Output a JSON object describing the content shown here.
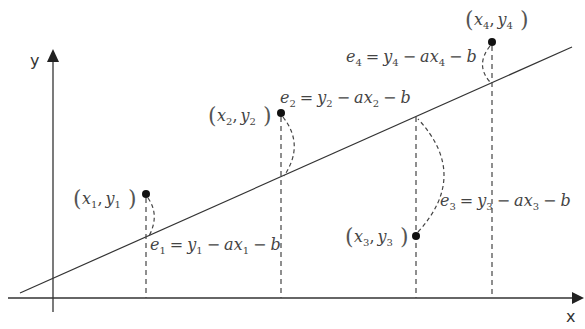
{
  "diagram": {
    "axes": {
      "x_label": "x",
      "y_label": "y"
    },
    "regression_line": {
      "equation": "y = ax + b",
      "from": [
        20,
        293
      ],
      "to": [
        572,
        47
      ]
    },
    "points": [
      {
        "id": 1,
        "label_x": "x",
        "label_y": "y",
        "sub": "1",
        "position": "above line",
        "px": [
          146,
          194
        ],
        "line_px": [
          146,
          237
        ]
      },
      {
        "id": 2,
        "label_x": "x",
        "label_y": "y",
        "sub": "2",
        "position": "above line",
        "px": [
          281,
          113
        ],
        "line_px": [
          281,
          177
        ]
      },
      {
        "id": 3,
        "label_x": "x",
        "label_y": "y",
        "sub": "3",
        "position": "below line",
        "px": [
          416,
          236
        ],
        "line_px": [
          416,
          117
        ]
      },
      {
        "id": 4,
        "label_x": "x",
        "label_y": "y",
        "sub": "4",
        "position": "above line",
        "px": [
          492,
          42
        ],
        "line_px": [
          492,
          83
        ]
      }
    ],
    "residuals": [
      {
        "id": 1,
        "e": "e",
        "sub": "1",
        "eq": "=",
        "y": "y",
        "minus1": "−",
        "a": "a",
        "x": "x",
        "minus2": "−",
        "b": "b",
        "text": "e1 = y1 − ax1 − b"
      },
      {
        "id": 2,
        "e": "e",
        "sub": "2",
        "eq": "=",
        "y": "y",
        "minus1": "−",
        "a": "a",
        "x": "x",
        "minus2": "−",
        "b": "b",
        "text": "e2 = y2 − ax2 − b"
      },
      {
        "id": 3,
        "e": "e",
        "sub": "3",
        "eq": "=",
        "y": "y",
        "minus1": "−",
        "a": "a",
        "x": "x",
        "minus2": "−",
        "b": "b",
        "text": "e3 = y3 − ax3 − b"
      },
      {
        "id": 4,
        "e": "e",
        "sub": "4",
        "eq": "=",
        "y": "y",
        "minus1": "−",
        "a": "a",
        "x": "x",
        "minus2": "−",
        "b": "b",
        "text": "e4 = y4 − ax4 − b"
      }
    ],
    "punctuation": {
      "open": "(",
      "close": ")",
      "comma": ","
    }
  }
}
